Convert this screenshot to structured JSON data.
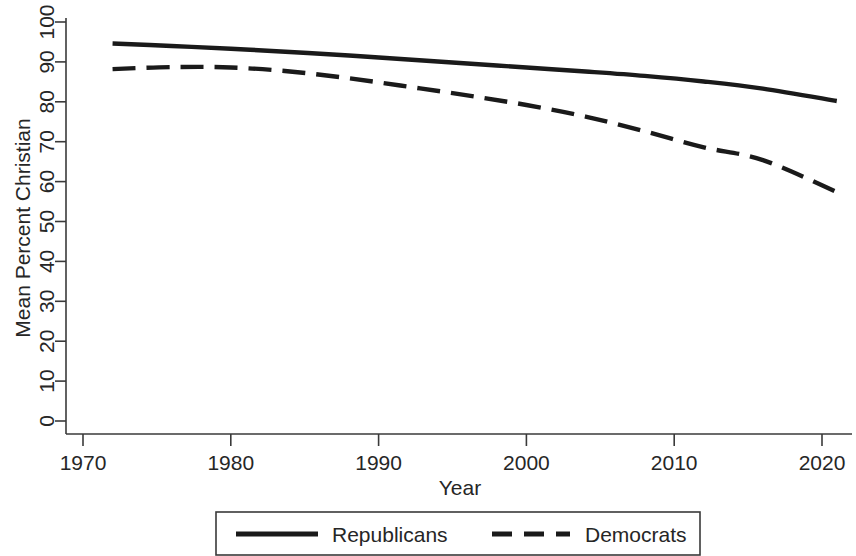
{
  "chart_data": {
    "type": "line",
    "title": "",
    "xlabel": "Year",
    "ylabel": "Mean Percent Christian",
    "xlim": [
      1968,
      2023
    ],
    "ylim": [
      0,
      100
    ],
    "xticks": [
      1970,
      1980,
      1990,
      2000,
      2010,
      2020
    ],
    "xtick_labels": [
      "1970",
      "1980",
      "1990",
      "2000",
      "2010",
      "2020"
    ],
    "yticks": [
      0,
      10,
      20,
      30,
      40,
      50,
      60,
      70,
      80,
      90,
      100
    ],
    "ytick_labels": [
      "0",
      "10",
      "20",
      "30",
      "40",
      "50",
      "60",
      "70",
      "80",
      "90",
      "100"
    ],
    "grid": false,
    "legend_position": "below-axes",
    "series": [
      {
        "name": "Republicans",
        "style": "solid",
        "color": "#1a1a1a",
        "x": [
          1972,
          1976,
          1980,
          1984,
          1988,
          1992,
          1996,
          2000,
          2004,
          2008,
          2012,
          2016,
          2021
        ],
        "values": [
          94.6,
          94.0,
          93.3,
          92.5,
          91.6,
          90.6,
          89.6,
          88.6,
          87.6,
          86.5,
          85.1,
          83.3,
          80.2
        ]
      },
      {
        "name": "Democrats",
        "style": "dashed",
        "color": "#1a1a1a",
        "x": [
          1972,
          1976,
          1980,
          1984,
          1988,
          1992,
          1996,
          2000,
          2004,
          2008,
          2012,
          2016,
          2021
        ],
        "values": [
          88.2,
          88.7,
          88.6,
          87.6,
          85.9,
          83.8,
          81.6,
          79.2,
          76.3,
          72.6,
          68.6,
          65.4,
          57.4
        ]
      }
    ]
  },
  "legend": {
    "entries": [
      {
        "label": "Republicans",
        "style": "solid"
      },
      {
        "label": "Democrats",
        "style": "dashed"
      }
    ]
  }
}
